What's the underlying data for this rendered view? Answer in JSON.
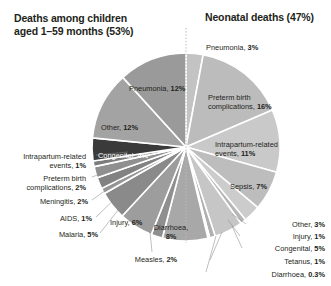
{
  "titles": {
    "left": "Deaths among children\naged 1–59 months (53%)",
    "right": "Neonatal deaths (47%)"
  },
  "colors": {
    "text": "#231f20",
    "background": "#ffffff",
    "separator": "#ffffff",
    "divider": "#b9b9b9"
  },
  "labels": {
    "pneumonia_neonatal": "Pneumonia,",
    "pneumonia_neonatal_val": "3%",
    "preterm_neonatal": "Preterm birth\ncomplications,",
    "preterm_neonatal_val": "16%",
    "intrapartum_neonatal": "Intrapartum-related\nevents,",
    "intrapartum_neonatal_val": "11%",
    "sepsis_neonatal": "Sepsis,",
    "sepsis_neonatal_val": "7%",
    "other_neonatal": "Other,",
    "other_neonatal_val": "3%",
    "injury_neonatal": "Injury,",
    "injury_neonatal_val": "1%",
    "congenital_neonatal": "Congenital,",
    "congenital_neonatal_val": "5%",
    "tetanus_neonatal": "Tetanus,",
    "tetanus_neonatal_val": "1%",
    "diarrhoea_neonatal": "Diarrhoea,",
    "diarrhoea_neonatal_val": "0.3%",
    "pneumonia_child": "Pneumonia,",
    "pneumonia_child_val": "12%",
    "other_child": "Other,",
    "other_child_val": "12%",
    "congenital_child": "Congenital,",
    "congenital_child_val": "4%",
    "intrapartum_child": "Intrapartum-related\nevents,",
    "intrapartum_child_val": "1%",
    "preterm_child": "Preterm birth\ncomplications,",
    "preterm_child_val": "2%",
    "meningitis_child": "Meningitis,",
    "meningitis_child_val": "2%",
    "aids_child": "AIDS,",
    "aids_child_val": "1%",
    "malaria_child": "Malaria,",
    "malaria_child_val": "5%",
    "injury_child": "Injury,",
    "injury_child_val": "6%",
    "measles_child": "Measles,",
    "measles_child_val": "2%",
    "diarrhoea_child": "Diarrhoea,\n",
    "diarrhoea_child_val": "8%"
  },
  "chart_data": {
    "type": "pie",
    "groups": [
      {
        "name": "Deaths among children aged 1–59 months",
        "share": 53
      },
      {
        "name": "Neonatal deaths",
        "share": 47
      }
    ],
    "start_angle_deg": 0,
    "direction": "clockwise",
    "center": [
      186,
      147
    ],
    "radius": 94,
    "labels_inside": [
      "Pneumonia, 12%",
      "Other, 12%",
      "Congenital, 4%",
      "Injury, 6%",
      "Diarrhoea, 8%",
      "Preterm birth complications, 16%",
      "Intrapartum-related events, 11%",
      "Sepsis, 7%"
    ],
    "slices": [
      {
        "label": "Pneumonia",
        "value": 3,
        "group": "neonatal",
        "color": "#c3c3c3"
      },
      {
        "label": "Preterm birth complications",
        "value": 16,
        "group": "neonatal",
        "color": "#bcbcbc"
      },
      {
        "label": "Intrapartum-related events",
        "value": 11,
        "group": "neonatal",
        "color": "#c9c9c9"
      },
      {
        "label": "Sepsis",
        "value": 7,
        "group": "neonatal",
        "color": "#bdbdbd"
      },
      {
        "label": "Other",
        "value": 3,
        "group": "neonatal",
        "color": "#cccccc"
      },
      {
        "label": "Injury",
        "value": 1,
        "group": "neonatal",
        "color": "#b6b6b6"
      },
      {
        "label": "Congenital",
        "value": 5,
        "group": "neonatal",
        "color": "#c6c6c6"
      },
      {
        "label": "Tetanus",
        "value": 1,
        "group": "neonatal",
        "color": "#b0b0b0"
      },
      {
        "label": "Diarrhoea",
        "value": 0.3,
        "group": "neonatal",
        "color": "#d2d2d2"
      },
      {
        "label": "Diarrhoea",
        "value": 8,
        "group": "child",
        "color": "#a8a8a8"
      },
      {
        "label": "Measles",
        "value": 2,
        "group": "child",
        "color": "#8f8f8f"
      },
      {
        "label": "Injury",
        "value": 6,
        "group": "child",
        "color": "#9d9d9d"
      },
      {
        "label": "Malaria",
        "value": 5,
        "group": "child",
        "color": "#8a8a8a"
      },
      {
        "label": "AIDS",
        "value": 1,
        "group": "child",
        "color": "#979797"
      },
      {
        "label": "Meningitis",
        "value": 2,
        "group": "child",
        "color": "#828282"
      },
      {
        "label": "Preterm birth complications",
        "value": 2,
        "group": "child",
        "color": "#909090"
      },
      {
        "label": "Intrapartum-related events",
        "value": 1,
        "group": "child",
        "color": "#7c7c7c"
      },
      {
        "label": "Congenital",
        "value": 4,
        "group": "child",
        "color": "#3a3a3a"
      },
      {
        "label": "Other",
        "value": 12,
        "group": "child",
        "color": "#a3a3a3"
      },
      {
        "label": "Pneumonia",
        "value": 12,
        "group": "child",
        "color": "#9a9a9a"
      }
    ]
  }
}
